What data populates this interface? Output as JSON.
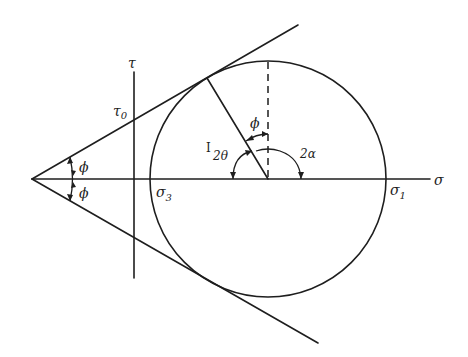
{
  "diagram": {
    "labels": {
      "tau_axis": "τ",
      "sigma_axis": "σ",
      "tau0": "τ",
      "tau0_sub": "0",
      "sigma3": "σ",
      "sigma3_sub": "3",
      "sigma1": "σ",
      "sigma1_sub": "1",
      "phi_upper": "ϕ",
      "phi_lower": "ϕ",
      "phi_circle": "ϕ",
      "two_theta": "2θ",
      "two_theta_tick": "I",
      "two_alpha": "2α"
    },
    "colors": {
      "ink": "#1e1e1e",
      "background": "#ffffff"
    }
  }
}
